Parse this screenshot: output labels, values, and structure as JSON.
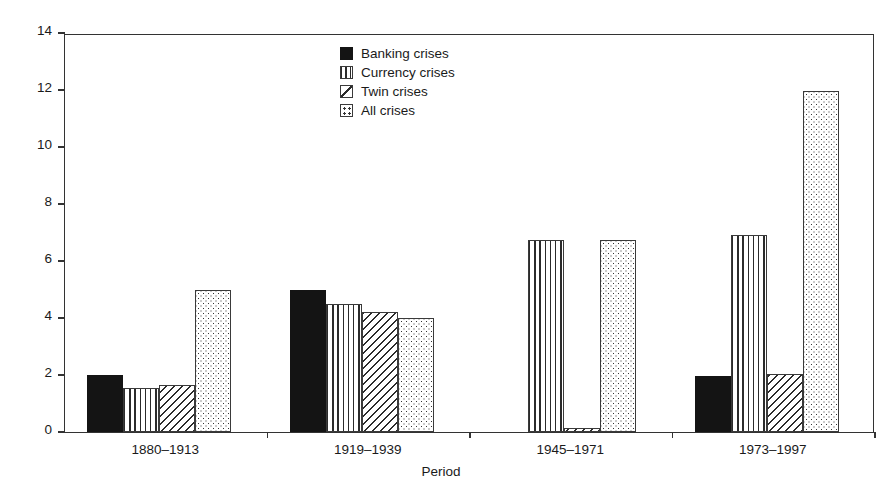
{
  "chart_data": {
    "type": "bar",
    "title": "",
    "xlabel": "Period",
    "ylabel": "percentage probability per year",
    "ylim": [
      0,
      14
    ],
    "ytick_labels": [
      "0",
      "2",
      "4",
      "6",
      "8",
      "10",
      "12",
      "14"
    ],
    "ytick_values": [
      0,
      2,
      4,
      6,
      8,
      10,
      12,
      14
    ],
    "grid": false,
    "legend_position": "top-center",
    "categories": [
      "1880–1913",
      "1919–1939",
      "1945–1971",
      "1973–1997"
    ],
    "series": [
      {
        "name": "Banking crises",
        "pattern": "solid",
        "values": [
          2.0,
          5.0,
          0.0,
          1.95
        ]
      },
      {
        "name": "Currency crises",
        "pattern": "vertical",
        "values": [
          1.55,
          4.5,
          6.75,
          6.9
        ]
      },
      {
        "name": "Twin crises",
        "pattern": "diagonal",
        "values": [
          1.65,
          4.2,
          0.15,
          2.05
        ]
      },
      {
        "name": "All crises",
        "pattern": "dotted",
        "values": [
          5.0,
          4.0,
          6.75,
          11.95
        ]
      }
    ]
  },
  "legend": {
    "items": [
      {
        "label": "Banking crises",
        "pattern": "solid"
      },
      {
        "label": "Currency crises",
        "pattern": "vertical"
      },
      {
        "label": "Twin crises",
        "pattern": "diagonal"
      },
      {
        "label": "All crises",
        "pattern": "dotted"
      }
    ]
  },
  "colors": {
    "axis": "#333333",
    "text": "#1a1a1a",
    "fill_solid": "#141414",
    "hatch": "#2b2b2b",
    "background": "#ffffff"
  }
}
